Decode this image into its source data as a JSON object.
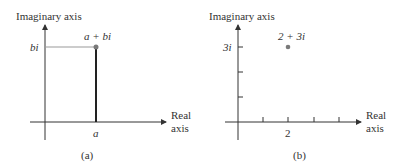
{
  "panels": [
    {
      "id": "a",
      "caption": "(a)",
      "y_axis_label": "Imaginary axis",
      "x_axis_label_line1": "Real",
      "x_axis_label_line2": "axis",
      "point_label": "a + bi",
      "y_tick_label": "bi",
      "x_tick_label": "a"
    },
    {
      "id": "b",
      "caption": "(b)",
      "y_axis_label": "Imaginary axis",
      "x_axis_label_line1": "Real",
      "x_axis_label_line2": "axis",
      "point_label": "2 + 3i",
      "y_tick_label": "3i",
      "x_tick_label": "2"
    }
  ],
  "colors": {
    "axis": "#333333",
    "point": "#7a7a7a",
    "guide_horizontal": "#999999",
    "guide_vertical": "#222222"
  }
}
